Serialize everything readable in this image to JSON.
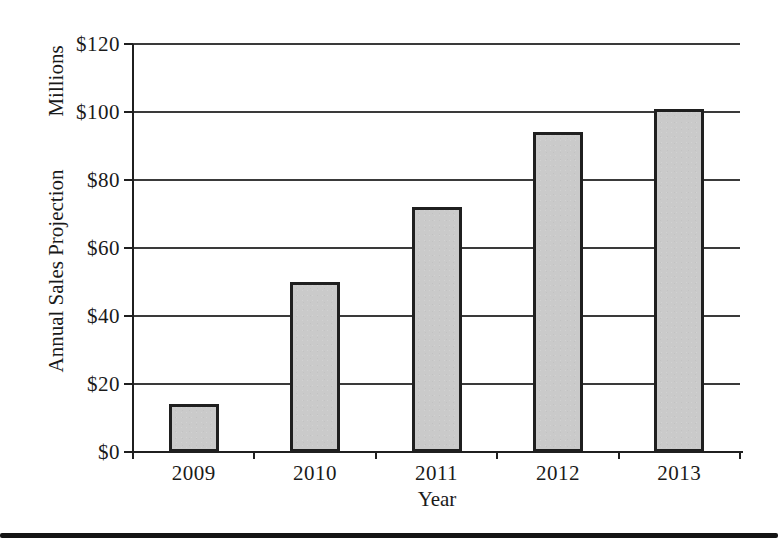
{
  "chart_data": {
    "type": "bar",
    "title": "",
    "categories": [
      "2009",
      "2010",
      "2011",
      "2012",
      "2013"
    ],
    "values": [
      14,
      50,
      72,
      94,
      101
    ],
    "xlabel": "Year",
    "ylabel": "Annual Sales Projection",
    "ylabel_unit": "Millions",
    "y_ticks": [
      "$0",
      "$20",
      "$40",
      "$60",
      "$80",
      "$100",
      "$120"
    ],
    "y_tick_values": [
      0,
      20,
      40,
      60,
      80,
      100,
      120
    ],
    "ylim": [
      0,
      120
    ],
    "grid": true,
    "legend": "none",
    "bar_fill": "#cacaca",
    "bar_border": "#1f1f1f",
    "axis_color": "#1f1f1f",
    "gridline_color": "#3a3a3a",
    "text_color": "#1a1a1a"
  },
  "page": {
    "bottom_rule_color": "#141414"
  }
}
